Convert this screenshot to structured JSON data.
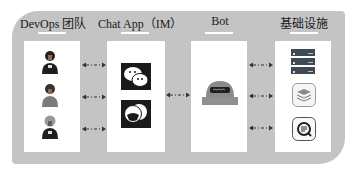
{
  "diagram": {
    "colors": {
      "panel": "#c4c4c4",
      "column": "#ffffff",
      "text": "#1a1a1a",
      "arrow": "#333333"
    },
    "columns": [
      {
        "title": "DevOps 团队",
        "items": [
          "person-icon",
          "person-icon",
          "person-icon"
        ]
      },
      {
        "title": "Chat App（IM）",
        "items": [
          "wechat-icon",
          "chat-app-icon"
        ]
      },
      {
        "title": "Bot",
        "items": [
          "robot-icon"
        ]
      },
      {
        "title": "基础设施",
        "items": [
          "server-rack-icon",
          "stack-layers-icon",
          "monitor-search-icon"
        ]
      }
    ],
    "connectors": [
      {
        "from": "DevOps 团队",
        "to": "Chat App（IM）",
        "style": "dash-dot bidirectional",
        "count": 3
      },
      {
        "from": "Chat App（IM）",
        "to": "Bot",
        "style": "dash-dot bidirectional",
        "count": 1
      },
      {
        "from": "Bot",
        "to": "基础设施",
        "style": "dash-dot bidirectional",
        "count": 3
      }
    ]
  }
}
